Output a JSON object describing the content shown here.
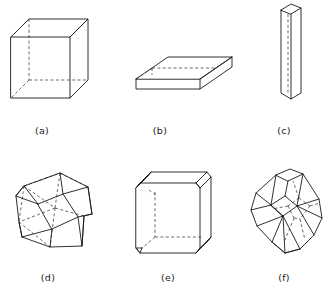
{
  "plate": {
    "background_color": "#ffffff",
    "line_color": "#1a1a1a",
    "hidden_line_color": "#3a3a3a",
    "width": 327,
    "height": 293,
    "figure_count": 6
  },
  "figures": [
    {
      "key": "a",
      "caption": "(a)",
      "caption_x": 42,
      "caption_y": 134,
      "shape_name": "cube",
      "description": "isometric cube, equant habit",
      "drawing_style": "line-drawing-with-hidden-dashed-edges"
    },
    {
      "key": "b",
      "caption": "(b)",
      "caption_x": 160,
      "caption_y": 134,
      "shape_name": "flattened-tabular-prism",
      "description": "square plate, tabular habit",
      "drawing_style": "line-drawing-with-hidden-dashed-edges"
    },
    {
      "key": "c",
      "caption": "(c)",
      "caption_x": 284,
      "caption_y": 134,
      "shape_name": "elongated-prism",
      "description": "tall thin square prism, acicular habit",
      "drawing_style": "line-drawing-with-hidden-dashed-edges"
    },
    {
      "key": "d",
      "caption": "(d)",
      "caption_x": 48,
      "caption_y": 281,
      "shape_name": "cuboctahedron",
      "description": "cube with corners truncated to midpoints of edges",
      "drawing_style": "line-drawing-with-hidden-dashed-edges"
    },
    {
      "key": "e",
      "caption": "(e)",
      "caption_x": 168,
      "caption_y": 281,
      "shape_name": "truncated-cube",
      "description": "cube with small triangular corner truncations",
      "drawing_style": "line-drawing-with-hidden-dashed-edges"
    },
    {
      "key": "f",
      "caption": "(f)",
      "caption_x": 284,
      "caption_y": 281,
      "shape_name": "truncated-octahedron",
      "description": "octahedron with corners truncated to square faces",
      "drawing_style": "line-drawing-with-hidden-dashed-edges"
    }
  ]
}
